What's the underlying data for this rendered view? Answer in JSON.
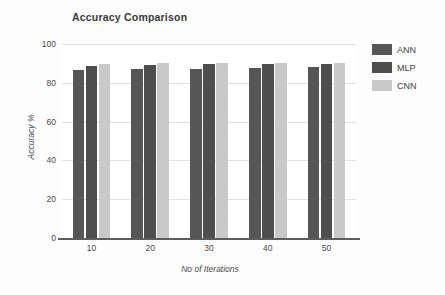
{
  "chart_data": {
    "type": "bar",
    "title": "Accuracy Comparison",
    "xlabel": "No of Iterations",
    "ylabel": "Accuracy %",
    "categories": [
      "10",
      "20",
      "30",
      "40",
      "50"
    ],
    "series": [
      {
        "name": "ANN",
        "values": [
          86.5,
          87.0,
          87.3,
          87.8,
          88.3
        ],
        "color": "#565656"
      },
      {
        "name": "MLP",
        "values": [
          88.8,
          89.2,
          89.6,
          89.7,
          89.7
        ],
        "color": "#4e4e4e"
      },
      {
        "name": "CNN",
        "values": [
          89.7,
          90.1,
          90.4,
          90.4,
          90.3
        ],
        "color": "#c9c9c9"
      }
    ],
    "ylim": [
      0,
      100
    ],
    "yticks": [
      "0",
      "20",
      "40",
      "60",
      "80",
      "100"
    ],
    "ytick_values": [
      0,
      20,
      40,
      60,
      80,
      100
    ],
    "grid": true,
    "grid_axis": "y",
    "legend_position": "right",
    "legend_entries": [
      "ANN",
      "MLP",
      "CNN"
    ],
    "background_color": "#fdfdfd",
    "plot_background_color": "#ffffff",
    "grid_color": "#e3e3e3",
    "axis_color": "#5d5d5d",
    "text_color": "#4a4a4a"
  }
}
